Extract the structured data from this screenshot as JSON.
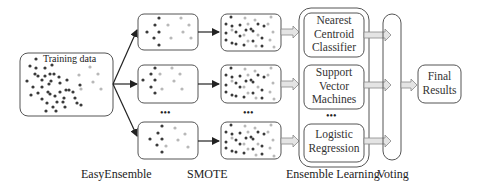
{
  "diagram": {
    "training_box": {
      "label": "Training data"
    },
    "ellipsis": "•••",
    "stages": [
      {
        "id": "easyensemble",
        "label": "EasyEnsemble"
      },
      {
        "id": "smote",
        "label": "SMOTE"
      },
      {
        "id": "ensemble-learning",
        "label": "Ensemble Learning"
      },
      {
        "id": "voting",
        "label": "Voting"
      }
    ],
    "classifiers": [
      {
        "line1": "Nearest",
        "line2": "Centroid",
        "line3": "Classifier"
      },
      {
        "line1": "Support",
        "line2": "Vector",
        "line3": "Machines"
      },
      {
        "line1": "Logistic",
        "line2": "Regression"
      }
    ],
    "final": {
      "line1": "Final",
      "line2": "Results"
    },
    "colors": {
      "majority_dot": "#3a3a3a",
      "minority_dot": "#b8b8b8",
      "border": "#555555",
      "wide_arrow_fill": "#e4e4e4"
    }
  }
}
